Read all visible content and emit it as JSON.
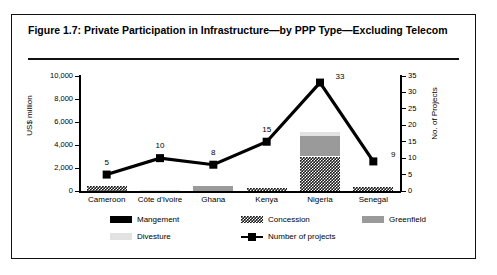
{
  "figure": {
    "title": "Figure 1.7: Private Participation in Infrastructure—by PPP Type—Excluding Telecom"
  },
  "chart_data": {
    "type": "bar",
    "title": "Figure 1.7: Private Participation in Infrastructure—by PPP Type—Excluding Telecom",
    "xlabel": "",
    "ylabel": "US$ million",
    "y2label": "No. of Projects",
    "ylim": [
      0,
      10000
    ],
    "y2lim": [
      0,
      35
    ],
    "yticks": [
      "0",
      "2,000",
      "4,000",
      "6,000",
      "8,000",
      "10,000"
    ],
    "ytick_values": [
      0,
      2000,
      4000,
      6000,
      8000,
      10000
    ],
    "y2ticks": [
      "0",
      "5",
      "10",
      "15",
      "20",
      "25",
      "30",
      "35"
    ],
    "y2tick_values": [
      0,
      5,
      10,
      15,
      20,
      25,
      30,
      35
    ],
    "grid": false,
    "legend_position": "bottom",
    "categories": [
      "Cameroon",
      "Côte d'Ivoire",
      "Ghana",
      "Kenya",
      "Nigeria",
      "Senegal"
    ],
    "series": [
      {
        "name": "Mangement",
        "values": [
          0,
          0,
          0,
          0,
          0,
          0
        ]
      },
      {
        "name": "Concession",
        "values": [
          400,
          0,
          0,
          280,
          3000,
          330
        ]
      },
      {
        "name": "Greenfield",
        "values": [
          0,
          0,
          420,
          0,
          1800,
          0
        ]
      },
      {
        "name": "Divesture",
        "values": [
          0,
          90,
          0,
          0,
          300,
          0
        ]
      }
    ],
    "line_series": {
      "name": "Number of projects",
      "values": [
        5,
        10,
        8,
        15,
        33,
        9
      ],
      "labels": [
        "5",
        "10",
        "8",
        "15",
        "33",
        "9"
      ],
      "axis": "right"
    }
  },
  "legend": {
    "items": [
      {
        "label": "Mangement",
        "swatch": "solid-black-swatch"
      },
      {
        "label": "Concession",
        "swatch": "checker-swatch"
      },
      {
        "label": "Greenfield",
        "swatch": "gray-swatch"
      },
      {
        "label": "Divesture",
        "swatch": "light-gray-swatch"
      },
      {
        "label": "Number of projects",
        "swatch": "line-marker-swatch"
      }
    ]
  }
}
